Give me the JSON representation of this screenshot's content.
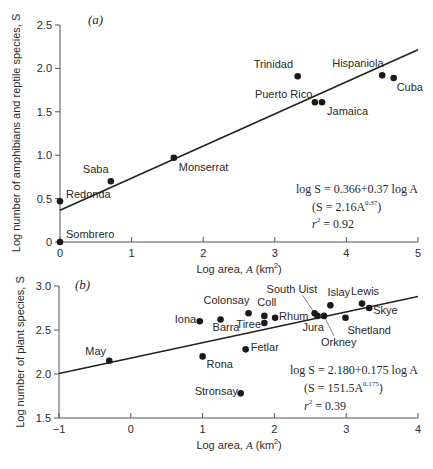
{
  "chart_data": [
    {
      "type": "scatter",
      "panel_label": "(a)",
      "title": "",
      "xlabel": "Log area, A (km²)",
      "ylabel": "Log number of amphibians and reptile species, S",
      "xlim": [
        0,
        5
      ],
      "ylim": [
        0,
        2.5
      ],
      "xticks": [
        0,
        1,
        2,
        3,
        4,
        5
      ],
      "yticks": [
        0,
        0.5,
        1.0,
        1.5,
        2.0,
        2.5
      ],
      "xtick_labels": [
        "0",
        "1",
        "2",
        "3",
        "4",
        "5"
      ],
      "ytick_labels": [
        "0",
        "0.5",
        "1.0",
        "1.5",
        "2.0",
        "2.5"
      ],
      "grid": false,
      "legend": null,
      "points": [
        {
          "label": "Sombrero",
          "x": 0.0,
          "y": 0.0
        },
        {
          "label": "Redonda",
          "x": 0.0,
          "y": 0.47
        },
        {
          "label": "Saba",
          "x": 0.71,
          "y": 0.7
        },
        {
          "label": "Monserrat",
          "x": 1.59,
          "y": 0.97
        },
        {
          "label": "Puerto Rico",
          "x": 3.56,
          "y": 1.61
        },
        {
          "label": "Jamaica",
          "x": 3.66,
          "y": 1.61
        },
        {
          "label": "Trinidad",
          "x": 3.32,
          "y": 1.91
        },
        {
          "label": "Hispaniola",
          "x": 4.5,
          "y": 1.92
        },
        {
          "label": "Cuba",
          "x": 4.66,
          "y": 1.89
        }
      ],
      "regression": {
        "intercept": 0.366,
        "slope": 0.37,
        "x_range": [
          0,
          5
        ]
      },
      "annotations": {
        "equation": "log S = 0.366+0.37 log A",
        "power_form": "(S = 2.16A",
        "power_exp": "0.37",
        "power_close": ")",
        "r2_label": "r",
        "r2_sup": "2",
        "r2_value": " = 0.92"
      }
    },
    {
      "type": "scatter",
      "panel_label": "(b)",
      "title": "",
      "xlabel": "Log area, A (km²)",
      "ylabel": "Log number of plant species, S",
      "xlim": [
        -1,
        4
      ],
      "ylim": [
        1.5,
        3.0
      ],
      "xticks": [
        -1,
        0,
        1,
        2,
        3,
        4
      ],
      "yticks": [
        1.5,
        2.0,
        2.5,
        3.0
      ],
      "xtick_labels": [
        "−1",
        "0",
        "1",
        "2",
        "3",
        "4"
      ],
      "ytick_labels": [
        "1.5",
        "2.0",
        "2.5",
        "3.0"
      ],
      "grid": false,
      "legend": null,
      "points": [
        {
          "label": "May",
          "x": -0.3,
          "y": 2.15
        },
        {
          "label": "Iona",
          "x": 0.96,
          "y": 2.6
        },
        {
          "label": "Barra",
          "x": 1.25,
          "y": 2.62
        },
        {
          "label": "Rona",
          "x": 1.0,
          "y": 2.2
        },
        {
          "label": "Colonsay",
          "x": 1.64,
          "y": 2.69
        },
        {
          "label": "Coll",
          "x": 1.86,
          "y": 2.66
        },
        {
          "label": "Tiree",
          "x": 1.86,
          "y": 2.58
        },
        {
          "label": "Rhum",
          "x": 2.01,
          "y": 2.64
        },
        {
          "label": "Fetlar",
          "x": 1.6,
          "y": 2.28
        },
        {
          "label": "Stronsay",
          "x": 1.53,
          "y": 1.78
        },
        {
          "label": "South Uist",
          "x": 2.56,
          "y": 2.69
        },
        {
          "label": "Jura",
          "x": 2.6,
          "y": 2.66
        },
        {
          "label": "Orkney",
          "x": 2.69,
          "y": 2.66
        },
        {
          "label": "Islay",
          "x": 2.78,
          "y": 2.78
        },
        {
          "label": "Shetland",
          "x": 2.99,
          "y": 2.64
        },
        {
          "label": "Lewis",
          "x": 3.22,
          "y": 2.8
        },
        {
          "label": "Skye",
          "x": 3.32,
          "y": 2.75
        }
      ],
      "regression": {
        "intercept": 2.18,
        "slope": 0.175,
        "x_range": [
          -1,
          4
        ]
      },
      "annotations": {
        "equation": "log S = 2.180+0.175 log A",
        "power_form": "(S = 151.5A",
        "power_exp": "0.175",
        "power_close": ")",
        "r2_label": "r",
        "r2_sup": "2",
        "r2_value": " = 0.39"
      }
    }
  ],
  "labels": {
    "a": {
      "panel": "(a)",
      "ylabel": "Log number of amphibians and reptile species, S",
      "xlabel_pre": "Log area, ",
      "xlabel_var": "A",
      "xlabel_unit": " (km",
      "xlabel_sup": "2",
      "xlabel_close": ")"
    },
    "b": {
      "panel": "(b)",
      "ylabel": "Log number of plant species, S",
      "xlabel_pre": "Log area, ",
      "xlabel_var": "A",
      "xlabel_unit": " (km",
      "xlabel_sup": "2",
      "xlabel_close": ")"
    }
  },
  "point_labels": {
    "a": {
      "Sombrero": "Sombrero",
      "Redonda": "Redonda",
      "Saba": "Saba",
      "Monserrat": "Monserrat",
      "Puerto Rico": "Puerto Rico",
      "Jamaica": "Jamaica",
      "Trinidad": "Trinidad",
      "Hispaniola": "Hispaniola",
      "Cuba": "Cuba"
    }
  }
}
